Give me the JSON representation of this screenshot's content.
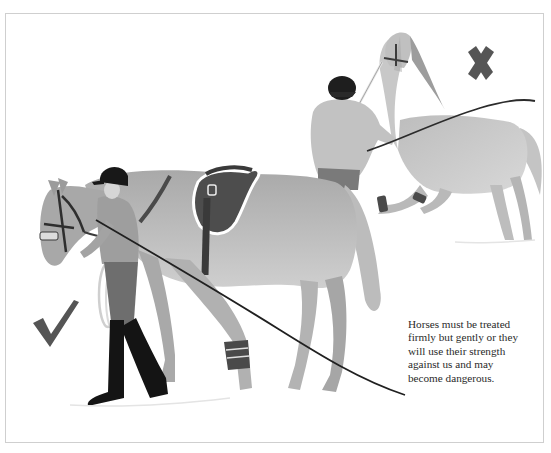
{
  "illustration": {
    "description": "Two scenes of horse handling: a rider calmly leading a saddled horse on foot (correct), and a person being dragged by a rearing horse while holding a whip (incorrect)",
    "style": "grayscale watercolor book illustration",
    "correct_mark": {
      "icon": "checkmark-icon",
      "meaning": "correct way",
      "color": "#555555"
    },
    "incorrect_mark": {
      "icon": "cross-icon",
      "meaning": "wrong way",
      "color": "#555555"
    }
  },
  "caption": {
    "text": "Horses must be treated firmly but gently or they will use their strength against us and may become dangerous.",
    "lines": [
      "Horses must be treated",
      "firmly but gently or they",
      "will use their strength",
      "against us and may",
      "become dangerous."
    ]
  },
  "colors": {
    "frame_border": "#cfcfcf",
    "background": "#ffffff",
    "horse_coat": "#b8b8b8",
    "tack_dark": "#3c3c3c",
    "text": "#2a2a2a"
  }
}
